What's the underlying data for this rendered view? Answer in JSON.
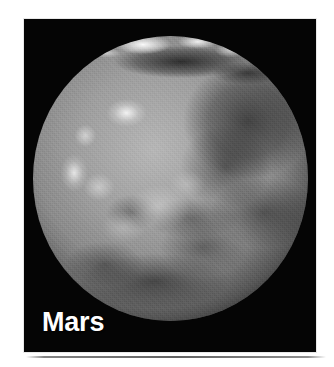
{
  "figure": {
    "subject": "Mars",
    "label": "Mars",
    "caption": "",
    "media_type": "photograph",
    "color_mode": "grayscale",
    "panel_background": "#050505",
    "page_background": "#ffffff",
    "label_color": "#ffffff"
  },
  "planet": {
    "name": "Mars",
    "view": "full-disk globe",
    "surface_features": [
      "north-polar-cap",
      "dark-albedo-band",
      "bright-volcanic-highlands",
      "dark-eastern-maria",
      "southern-dark-terrain"
    ],
    "disk_tone_light": "#b9b4ab",
    "disk_tone_mid": "#8c867d",
    "disk_tone_dark": "#4a463f"
  },
  "artifacts": {
    "scan_line": "bottom-edge-scan-line"
  }
}
